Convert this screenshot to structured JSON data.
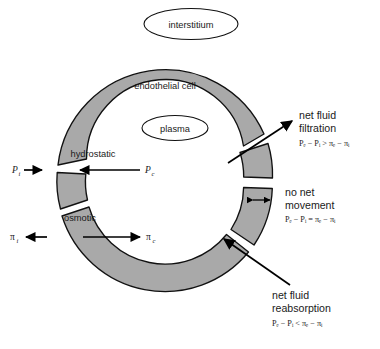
{
  "figure": {
    "background_color": "#ffffff",
    "cell_fill_color": "#a9a9a9",
    "outline_color": "#111111"
  },
  "compartments": {
    "interstitium": "interstitium",
    "endothelium": "endothelial cell",
    "plasma": "plasma"
  },
  "forces": {
    "hydrostatic_label": "hydrostatic",
    "osmotic_label": "osmotic",
    "hydrostatic_interstitial": "P",
    "hydrostatic_interstitial_sub": "i",
    "hydrostatic_capillary": "P",
    "hydrostatic_capillary_sub": "c",
    "osmotic_interstitial": "π",
    "osmotic_interstitial_sub": "i",
    "osmotic_capillary": "π",
    "osmotic_capillary_sub": "c"
  },
  "callouts": [
    {
      "id": "filtration",
      "line1": "net fluid",
      "line2": "filtration",
      "formula": "Pₑ − Pᵢ > πₑ − πᵢ",
      "relation": ">"
    },
    {
      "id": "no-net",
      "line1": "no net",
      "line2": "movement",
      "formula": "Pₑ − Pᵢ = πₑ − πᵢ",
      "relation": "="
    },
    {
      "id": "reabsorption",
      "line1": "net fluid",
      "line2": "reabsorption",
      "formula": "Pₑ − Pᵢ < πₑ − πᵢ",
      "relation": "<"
    }
  ]
}
